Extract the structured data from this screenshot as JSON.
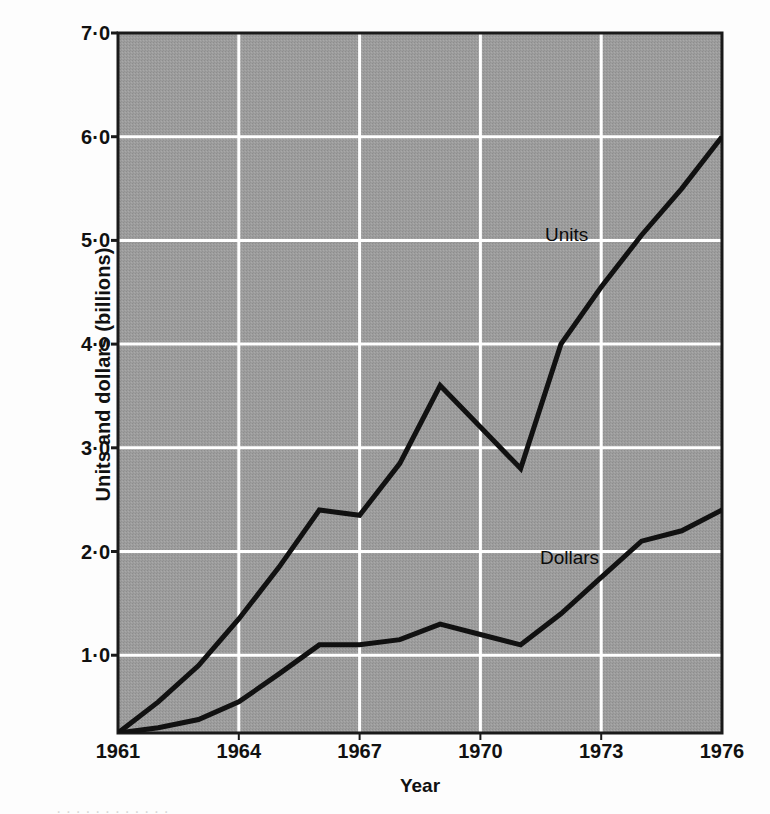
{
  "chart_data": {
    "type": "line",
    "title": "",
    "xlabel": "Year",
    "ylabel": "Units and dollars (billions)",
    "xlim": [
      1961,
      1976
    ],
    "ylim": [
      0.25,
      7.0
    ],
    "grid": true,
    "legend_position": "inline-series-labels",
    "x_ticks": [
      "1961",
      "1964",
      "1967",
      "1970",
      "1973",
      "1976"
    ],
    "x_tick_values": [
      1961,
      1964,
      1967,
      1970,
      1973,
      1976
    ],
    "y_ticks": [
      "1·0",
      "2·0",
      "3·0",
      "4·0",
      "5·0",
      "6·0",
      "7·0"
    ],
    "y_tick_values": [
      1.0,
      2.0,
      3.0,
      4.0,
      5.0,
      6.0,
      7.0
    ],
    "x": [
      1961,
      1962,
      1963,
      1964,
      1965,
      1966,
      1967,
      1968,
      1969,
      1970,
      1971,
      1972,
      1973,
      1974,
      1975,
      1976
    ],
    "series": [
      {
        "name": "Units",
        "values": [
          0.25,
          0.55,
          0.9,
          1.35,
          1.85,
          2.4,
          2.35,
          2.85,
          3.6,
          3.2,
          2.8,
          4.0,
          4.55,
          5.05,
          5.5,
          6.0
        ]
      },
      {
        "name": "Dollars",
        "values": [
          0.25,
          0.3,
          0.38,
          0.55,
          0.82,
          1.1,
          1.1,
          1.15,
          1.3,
          1.2,
          1.1,
          1.4,
          1.75,
          2.1,
          2.2,
          2.4
        ]
      }
    ],
    "annotations": [
      {
        "text": "Units",
        "x": 1972.6,
        "y": 4.9
      },
      {
        "text": "Dollars",
        "x": 1972.4,
        "y": 2.2
      }
    ]
  },
  "style": {
    "plot_background": "#9a9a9a",
    "gridline_color": "#ffffff",
    "line_color": "#111111",
    "axis_color": "#1a1a1a",
    "text_color": "#111111",
    "page_background": "#fdfdfd"
  },
  "caption": {
    "clipped_text": "·  ·   ·    ·      ·     ·       ·      ·     ·    ·      ·    ·"
  }
}
